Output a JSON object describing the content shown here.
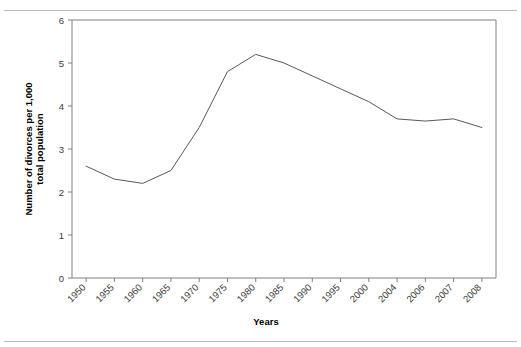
{
  "chart_data": {
    "type": "line",
    "title": "",
    "xlabel": "Years",
    "ylabel": "Number of divorces per 1,000 total population",
    "categories": [
      "1950",
      "1955",
      "1960",
      "1965",
      "1970",
      "1975",
      "1980",
      "1985",
      "1990",
      "1995",
      "2000",
      "2004",
      "2006",
      "2007",
      "2008"
    ],
    "values": [
      2.6,
      2.3,
      2.2,
      2.5,
      3.5,
      4.8,
      5.2,
      5.0,
      4.7,
      4.4,
      4.1,
      3.7,
      3.65,
      3.7,
      3.5
    ],
    "series": [
      {
        "name": "Divorce rate",
        "values": [
          2.6,
          2.3,
          2.2,
          2.5,
          3.5,
          4.8,
          5.2,
          5.0,
          4.7,
          4.4,
          4.1,
          3.7,
          3.65,
          3.7,
          3.5
        ]
      }
    ],
    "ylim": [
      0,
      6
    ],
    "yticks": [
      0,
      1,
      2,
      3,
      4,
      5,
      6
    ],
    "ytick_labels": [
      "0",
      "1",
      "2",
      "3",
      "4",
      "5",
      "6"
    ],
    "grid": false,
    "legend": false,
    "legend_position": "none",
    "line_color": "#595959",
    "background_color": "#ffffff",
    "axis_color": "#808080",
    "xtick_label_rotation": -45
  }
}
